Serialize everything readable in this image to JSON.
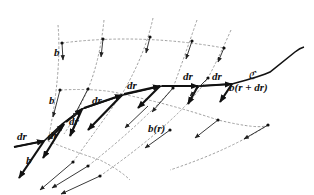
{
  "diagram": {
    "curve_label": "ℭ",
    "labels": {
      "b_top": "b",
      "b_mid": "b",
      "b_bottom": "b",
      "b_r": "b(r)",
      "b_r_dr": "b(r + dr)",
      "dr": "dr"
    },
    "dr_labels": [
      "dr",
      "dr",
      "dr",
      "dr",
      "dr",
      "dr",
      "dr"
    ],
    "colors": {
      "ink": "#111111",
      "grid": "#888888",
      "background": "#ffffff"
    }
  }
}
